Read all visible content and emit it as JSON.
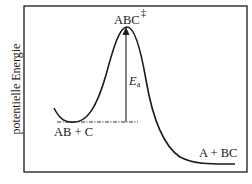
{
  "diagram": {
    "type": "energy-profile",
    "y_axis_label": "potentielle Energie",
    "labels": {
      "transition_state": "ABC",
      "transition_state_mark": "‡",
      "reactants": "AB + C",
      "products": "A + BC",
      "activation_energy_symbol": "E",
      "activation_energy_subscript": "a"
    },
    "colors": {
      "curve": "#1a1a1a",
      "frame": "#1a1a1a",
      "dashed_line": "#333333",
      "background": "#ffffff"
    }
  }
}
